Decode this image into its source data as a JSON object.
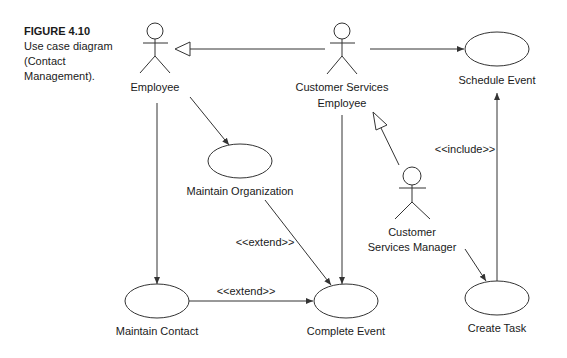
{
  "caption": {
    "figure_label": "FIGURE 4.10",
    "text": "Use case diagram (Contact Management)."
  },
  "actors": {
    "employee": "Employee",
    "cse_line1": "Customer Services",
    "cse_line2": "Employee",
    "csm_line1": "Customer",
    "csm_line2": "Services Manager"
  },
  "use_cases": {
    "schedule_event": "Schedule Event",
    "maintain_organization": "Maintain Organization",
    "maintain_contact": "Maintain Contact",
    "complete_event": "Complete Event",
    "create_task": "Create Task"
  },
  "stereotypes": {
    "include": "<<include>>",
    "extend_org": "<<extend>>",
    "extend_contact": "<<extend>>"
  },
  "colors": {
    "line": "#333333",
    "text": "#1a1a1a",
    "background": "#ffffff"
  }
}
